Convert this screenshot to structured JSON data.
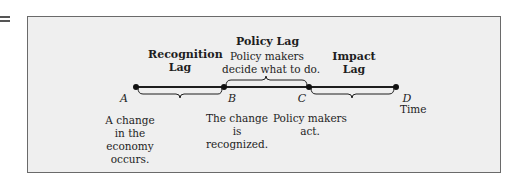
{
  "figure": {
    "lags": {
      "recognition": {
        "title_line1": "Recognition",
        "title_line2": "Lag"
      },
      "policy": {
        "title": "Policy Lag",
        "desc_line1": "Policy makers",
        "desc_line2": "decide what to do."
      },
      "impact": {
        "title_line1": "Impact",
        "title_line2": "Lag"
      }
    },
    "points": {
      "A": {
        "label": "A",
        "desc": [
          "A change",
          "in the",
          "economy",
          "occurs."
        ]
      },
      "B": {
        "label": "B",
        "desc": [
          "The change",
          "is",
          "recognized."
        ]
      },
      "C": {
        "label": "C",
        "desc": [
          "Policy makers",
          "act."
        ]
      },
      "D": {
        "label": "D",
        "desc": [
          "Time"
        ]
      }
    },
    "colors": {
      "panel_bg": "#efefef",
      "panel_border": "#6a6a6a",
      "line": "#1e1e1e"
    }
  }
}
